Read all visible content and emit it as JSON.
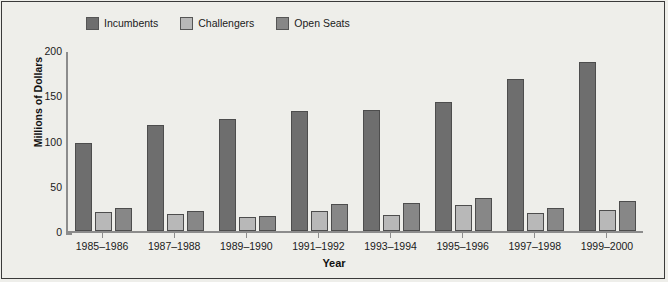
{
  "chart_data": {
    "type": "bar",
    "title": "",
    "xlabel": "Year",
    "ylabel": "Millions of Dollars",
    "ylim": [
      0,
      200
    ],
    "yticks": [
      0,
      50,
      100,
      150,
      200
    ],
    "grid": false,
    "legend_position": "top-left",
    "categories": [
      "1985–1986",
      "1987–1988",
      "1989–1990",
      "1991–1992",
      "1993–1994",
      "1995–1996",
      "1997–1998",
      "1999–2000"
    ],
    "series": [
      {
        "name": "Incumbents",
        "color": "#6e6e6e",
        "values": [
          97,
          117,
          124,
          133,
          134,
          143,
          168,
          187
        ]
      },
      {
        "name": "Challengers",
        "color": "#b8b8b8",
        "values": [
          21,
          19,
          15,
          22,
          18,
          29,
          20,
          23
        ]
      },
      {
        "name": "Open Seats",
        "color": "#878787",
        "values": [
          25,
          22,
          17,
          30,
          31,
          37,
          25,
          33
        ]
      }
    ]
  },
  "legend": {
    "items": [
      {
        "label": "Incumbents",
        "color": "#6e6e6e"
      },
      {
        "label": "Challengers",
        "color": "#b8b8b8"
      },
      {
        "label": "Open Seats",
        "color": "#878787"
      }
    ]
  },
  "axes": {
    "y_title": "Millions of Dollars",
    "x_title": "Year",
    "y_tick_labels": [
      "200",
      "150",
      "100",
      "50",
      "0"
    ],
    "x_tick_labels": [
      "1985–1986",
      "1987–1988",
      "1989–1990",
      "1991–1992",
      "1993–1994",
      "1995–1996",
      "1997–1998",
      "1999–2000"
    ]
  }
}
